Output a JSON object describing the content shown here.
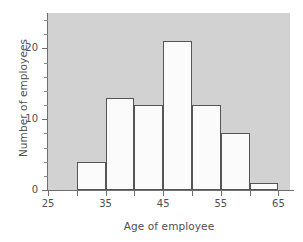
{
  "chart_data": {
    "type": "bar",
    "title": "",
    "subtitle": "",
    "xlabel": "Age of employee",
    "ylabel": "Number of employees",
    "xlim": [
      25,
      67
    ],
    "ylim": [
      0,
      25
    ],
    "grid": false,
    "legend": null,
    "bin_width": 5,
    "bin_edges": [
      30,
      35,
      40,
      45,
      50,
      55,
      60,
      65
    ],
    "categories": [
      "30-35",
      "35-40",
      "40-45",
      "45-50",
      "50-55",
      "55-60",
      "60-65"
    ],
    "values": [
      4,
      13,
      12,
      21,
      12,
      8,
      1
    ],
    "x_major_ticks": [
      25,
      35,
      45,
      55,
      65
    ],
    "x_minor_ticks": [
      30,
      40,
      50,
      60
    ],
    "x_tick_labels": [
      "25",
      "35",
      "45",
      "55",
      "65"
    ],
    "y_major_ticks": [
      0,
      10,
      20
    ],
    "y_minor_ticks": [
      2,
      4,
      6,
      8,
      12,
      14,
      16,
      18,
      22,
      24
    ],
    "y_tick_labels": [
      "0",
      "10",
      "20"
    ],
    "colors": {
      "panel_background": "#d2d2d2",
      "bar_fill": "#fbfbfb",
      "bar_edge": "#555555",
      "axis": "#6f6f6f",
      "text": "#4f4f4f",
      "figure_background": "#ffffff"
    }
  }
}
